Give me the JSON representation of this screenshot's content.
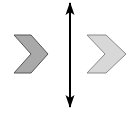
{
  "figure": {
    "title": "Two chevron arrow shapes separated by a vertical double-headed arrow",
    "canvas": {
      "width": 140,
      "height": 113,
      "background_color": "#FFFFFF"
    },
    "shapes": {
      "left_chevron": {
        "name": "Left chevron",
        "direction": "right",
        "fill_color": "#A9A9A9",
        "stroke_color": "#555555",
        "stroke_width": 1,
        "bounds": {
          "x": 14,
          "y": 35,
          "width": 34,
          "height": 38
        },
        "points": "14,35 31,54 14,73 31,73 48,54 31,35"
      },
      "right_chevron": {
        "name": "Right chevron",
        "direction": "right",
        "fill_color": "#D8D8D8",
        "stroke_color": "#8A8A8A",
        "stroke_width": 1,
        "bounds": {
          "x": 87,
          "y": 35,
          "width": 39,
          "height": 38
        },
        "points": "87,35 105,54 87,73 106,73 126,54 106,35"
      },
      "divider_arrow": {
        "name": "Vertical double-headed arrow",
        "color": "#000000",
        "shaft_x": 70,
        "top_y": 2,
        "bottom_y": 108,
        "shaft_width": 2,
        "head_width": 9,
        "head_height": 12,
        "top_head_points": "70,2 74.5,15 70,12 65.5,15",
        "bottom_head_points": "70,108 65.5,95 70,98 74.5,95"
      }
    }
  }
}
